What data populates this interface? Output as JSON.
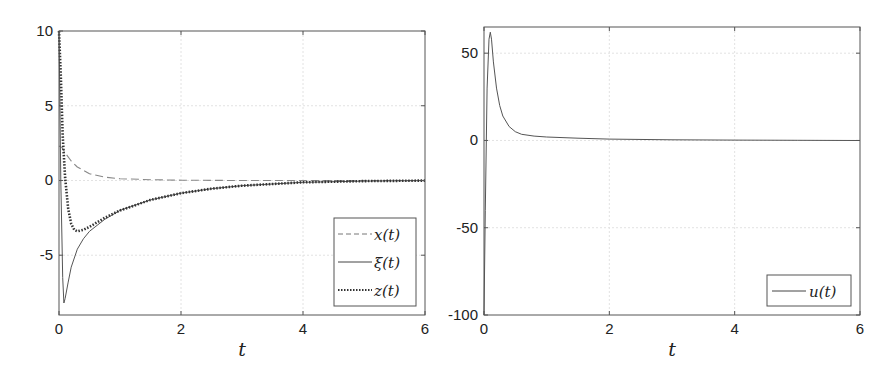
{
  "chart_data": [
    {
      "type": "line",
      "title": "",
      "xlabel": "t",
      "ylabel": "",
      "xlim": [
        0,
        6
      ],
      "ylim": [
        -9,
        10
      ],
      "xticks": [
        0,
        2,
        4,
        6
      ],
      "yticks": [
        10,
        5,
        0,
        -5
      ],
      "grid": true,
      "legend_position": "lower right",
      "series": [
        {
          "name": "x(t)",
          "style": "dashed",
          "x": [
            0,
            0.05,
            0.1,
            0.2,
            0.3,
            0.5,
            0.75,
            1.0,
            1.5,
            2,
            3,
            4,
            5,
            6
          ],
          "values": [
            2.3,
            2.2,
            1.85,
            1.3,
            0.9,
            0.45,
            0.22,
            0.12,
            0.05,
            0.02,
            0.0,
            0.0,
            0.0,
            0.0
          ]
        },
        {
          "name": "ξ(t)",
          "style": "solid",
          "x": [
            0,
            0.03,
            0.06,
            0.08,
            0.1,
            0.15,
            0.2,
            0.3,
            0.4,
            0.5,
            0.75,
            1.0,
            1.5,
            2,
            2.5,
            3,
            4,
            5,
            6
          ],
          "values": [
            10,
            0,
            -6.5,
            -8.2,
            -7.9,
            -6.8,
            -5.8,
            -4.6,
            -3.9,
            -3.4,
            -2.6,
            -2.0,
            -1.3,
            -0.85,
            -0.55,
            -0.35,
            -0.12,
            -0.04,
            -0.01
          ]
        },
        {
          "name": "z(t)",
          "style": "dotted",
          "x": [
            0,
            0.03,
            0.06,
            0.1,
            0.15,
            0.2,
            0.25,
            0.3,
            0.4,
            0.5,
            0.75,
            1.0,
            1.5,
            2,
            2.5,
            3,
            4,
            5,
            6
          ],
          "values": [
            10,
            7,
            3,
            0.2,
            -1.9,
            -2.9,
            -3.3,
            -3.4,
            -3.3,
            -3.1,
            -2.5,
            -2.0,
            -1.3,
            -0.85,
            -0.55,
            -0.35,
            -0.12,
            -0.04,
            -0.01
          ]
        }
      ]
    },
    {
      "type": "line",
      "title": "",
      "xlabel": "t",
      "ylabel": "",
      "xlim": [
        0,
        6
      ],
      "ylim": [
        -100,
        65
      ],
      "xticks": [
        0,
        2,
        4,
        6
      ],
      "yticks": [
        50,
        0,
        -50,
        -100
      ],
      "grid": true,
      "legend_position": "lower right",
      "series": [
        {
          "name": "u(t)",
          "style": "solid",
          "x": [
            0,
            0.02,
            0.05,
            0.08,
            0.1,
            0.12,
            0.15,
            0.2,
            0.25,
            0.3,
            0.4,
            0.5,
            0.6,
            0.8,
            1.0,
            1.5,
            2,
            3,
            4,
            5,
            6
          ],
          "values": [
            -100,
            -40,
            30,
            58,
            62,
            58,
            45,
            30,
            20,
            14,
            8,
            5,
            3.5,
            2.5,
            2,
            1.3,
            0.8,
            0.4,
            0.2,
            0.1,
            0
          ]
        }
      ]
    }
  ],
  "plots": [
    {
      "xlabel": "t",
      "legend": [
        "x(t)",
        "ξ(t)",
        "z(t)"
      ],
      "xtick_labels": [
        "0",
        "2",
        "4",
        "6"
      ],
      "ytick_labels": [
        "10",
        "5",
        "0",
        "-5"
      ]
    },
    {
      "xlabel": "t",
      "legend": [
        "u(t)"
      ],
      "xtick_labels": [
        "0",
        "2",
        "4",
        "6"
      ],
      "ytick_labels": [
        "50",
        "0",
        "-50",
        "-100"
      ]
    }
  ]
}
